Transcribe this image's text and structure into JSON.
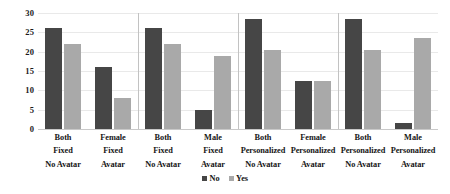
{
  "chart_data": {
    "type": "bar",
    "title": "",
    "subtitle": "",
    "xlabel": "",
    "ylabel": "",
    "ylim": [
      0,
      30
    ],
    "yticks": [
      0,
      5,
      10,
      15,
      20,
      25,
      30
    ],
    "grid": true,
    "legend_position": "bottom",
    "legend": [
      "No",
      "Yes"
    ],
    "series": [
      {
        "name": "No",
        "color": "#464646",
        "values": [
          26,
          16,
          26,
          5,
          28.5,
          12.5,
          28.5,
          1.5
        ]
      },
      {
        "name": "Yes",
        "color": "#a9a9a9",
        "values": [
          22,
          8,
          22,
          19,
          20.5,
          12.5,
          20.5,
          23.5
        ]
      }
    ],
    "categories": [
      "Both Fixed No Avatar",
      "Female Fixed Avatar",
      "Both Fixed No Avatar",
      "Male Fixed Avatar",
      "Both Personalized No Avatar",
      "Female Personalized Avatar",
      "Both Personalized No Avatar",
      "Male Personalized Avatar"
    ],
    "panels": [
      {
        "groups": [
          {
            "label_lines": [
              "Both",
              "Fixed",
              "No Avatar"
            ],
            "no": 26,
            "yes": 22
          },
          {
            "label_lines": [
              "Female",
              "Fixed",
              "Avatar"
            ],
            "no": 16,
            "yes": 8
          }
        ]
      },
      {
        "groups": [
          {
            "label_lines": [
              "Both",
              "Fixed",
              "No Avatar"
            ],
            "no": 26,
            "yes": 22
          },
          {
            "label_lines": [
              "Male",
              "Fixed",
              "Avatar"
            ],
            "no": 5,
            "yes": 19
          }
        ]
      },
      {
        "groups": [
          {
            "label_lines": [
              "Both",
              "Personalized",
              "No Avatar"
            ],
            "no": 28.5,
            "yes": 20.5
          },
          {
            "label_lines": [
              "Female",
              "Personalized",
              "Avatar"
            ],
            "no": 12.5,
            "yes": 12.5
          }
        ]
      },
      {
        "groups": [
          {
            "label_lines": [
              "Both",
              "Personalized",
              "No Avatar"
            ],
            "no": 28.5,
            "yes": 20.5
          },
          {
            "label_lines": [
              "Male",
              "Personalized",
              "Avatar"
            ],
            "no": 1.5,
            "yes": 23.5
          }
        ]
      }
    ]
  },
  "axis": {
    "y_tick_labels": [
      "30",
      "25",
      "20",
      "15",
      "10",
      "5",
      "0"
    ]
  },
  "legend": {
    "items": [
      {
        "label": "No",
        "color": "#464646"
      },
      {
        "label": "Yes",
        "color": "#a9a9a9"
      }
    ]
  },
  "colors": {
    "series_no": "#464646",
    "series_yes": "#a9a9a9",
    "gridline": "#e9e9e9",
    "divider": "#c2c2c2",
    "text": "#161616",
    "background": "#ffffff"
  }
}
